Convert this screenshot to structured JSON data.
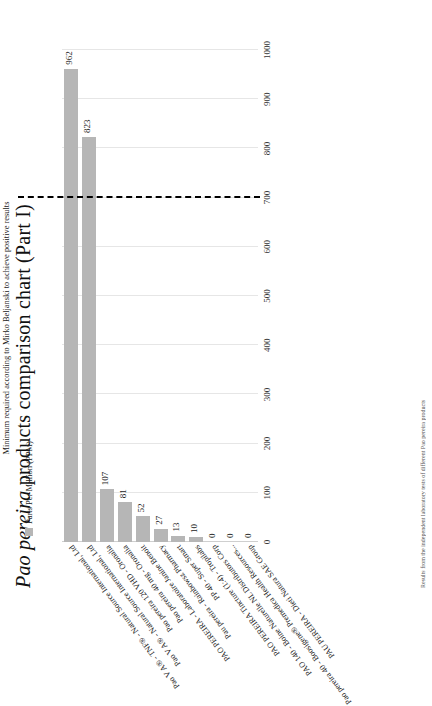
{
  "title": {
    "species": "Pao pereira",
    "rest": " products comparison chart (Part I)"
  },
  "legend": {
    "label": "Parts Per Million (PPM)",
    "swatch_color": "#b6b6b6"
  },
  "threshold": {
    "label": "Minimum required according to Mirko Beljanski  to achieve positive results",
    "value": 700,
    "color": "#000000"
  },
  "footnote": "Results from the independent laboratory tests of different Pao pereira products",
  "chart_data": {
    "type": "bar",
    "orientation": "horizontal",
    "title": "Pao pereira products comparison chart (Part I)",
    "xlabel": "",
    "ylabel": "Parts Per Million (PPM)",
    "ylim": [
      0,
      1000
    ],
    "tick_labels": [
      "0",
      "100",
      "200",
      "300",
      "400",
      "500",
      "600",
      "700",
      "800",
      "900",
      "1000"
    ],
    "tick_values": [
      0,
      100,
      200,
      300,
      400,
      500,
      600,
      700,
      800,
      900,
      1000
    ],
    "grid": true,
    "legend_position": "top-left",
    "series_name": "Parts Per Million (PPM)",
    "bar_color": "#b6b6b6",
    "categories": [
      "PAU PEREIRA - Dieti Natura SAE Group",
      "Pao pereira 40 - Boosigene® Premedica Health Resources...",
      "PAO 140 - Boine Naturelle NL Distributors Corp",
      "PAO PEREIRA Tincture (1:4) - Tropilabs",
      "PP 40 - Super Smart",
      "Pau pereira - Rainbowsz Pharmacy",
      "PAO PEREIRA - Laboratoire Janine Benoit",
      "Pao pereira 40 mg - Oronalia",
      "Pao pereira 120 VHD - Oronalia",
      "Pao V A® - Natural Source International, Ltd",
      "Pao V A® - TNF® - Natural Source International, Ltd"
    ],
    "values": [
      0,
      0,
      0,
      10,
      13,
      27,
      52,
      81,
      107,
      823,
      962
    ],
    "value_labels": [
      "0",
      "0",
      "0",
      "10",
      "13",
      "27",
      "52",
      "81",
      "107",
      "823",
      "962"
    ]
  }
}
